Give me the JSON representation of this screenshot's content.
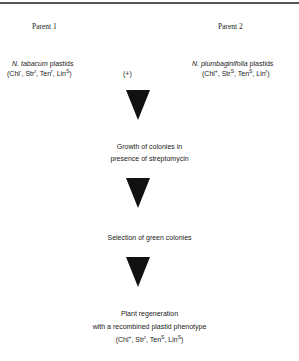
{
  "parent1": {
    "heading": "Parent 1",
    "species": "N. tabacum",
    "suffix": " plastids",
    "genotype": [
      {
        "name": "Chl",
        "sup": "-"
      },
      {
        "name": "Str",
        "sup": "r"
      },
      {
        "name": "Ten",
        "sup": "r"
      },
      {
        "name": "Lin",
        "sup": "S"
      }
    ]
  },
  "cross_symbol": "(+)",
  "parent2": {
    "heading": "Parent 2",
    "species": "N. plumbaginifolia",
    "suffix": " plastids",
    "genotype": [
      {
        "name": "Chl",
        "sup": "+"
      },
      {
        "name": "Str",
        "sup": "S"
      },
      {
        "name": "Ten",
        "sup": "S"
      },
      {
        "name": "Lin",
        "sup": "r"
      }
    ]
  },
  "steps": [
    {
      "line1": "Growth of colonies in",
      "line2": "presence of streptomycin"
    },
    {
      "line1": "Selection of green colonies"
    },
    {
      "line1": "Plant regeneration",
      "line2": "with a recombined plastid phenotype"
    }
  ],
  "result_genotype": [
    {
      "name": "Chl",
      "sup": "+"
    },
    {
      "name": "Str",
      "sup": "r"
    },
    {
      "name": "Ten",
      "sup": "S"
    },
    {
      "name": "Lin",
      "sup": "S"
    }
  ],
  "colors": {
    "arrow": "#111111",
    "rule": "#555555",
    "text": "#222222"
  }
}
